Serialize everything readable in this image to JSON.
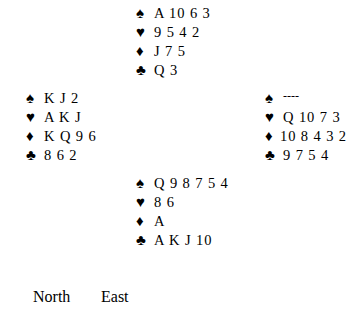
{
  "diagram": {
    "type": "bridge-deal",
    "background_color": "#ffffff",
    "text_color": "#000000",
    "suit_symbols": {
      "spades": "♠",
      "hearts": "♥",
      "diamonds": "♦",
      "clubs": "♣"
    },
    "hands": {
      "north": {
        "position_label": "North",
        "spades": "A 10 6 3",
        "hearts": "9 5 4 2",
        "diamonds": "J 7 5",
        "clubs": "Q 3"
      },
      "west": {
        "position_label": "West",
        "spades": "K J 2",
        "hearts": "A K J",
        "diamonds": "K Q 9 6",
        "clubs": "8 6 2"
      },
      "east": {
        "position_label": "East",
        "spades": "----",
        "hearts": "Q 10 7 3",
        "diamonds": "10 8 4 3 2",
        "clubs": "9 7 5 4"
      },
      "south": {
        "position_label": "South",
        "spades": "Q 9 8 7 5 4",
        "hearts": "8 6",
        "diamonds": "A",
        "clubs": "A K J 10"
      }
    }
  },
  "bidding_table": {
    "headers": {
      "west": "st",
      "north": "North",
      "east": "East"
    }
  }
}
